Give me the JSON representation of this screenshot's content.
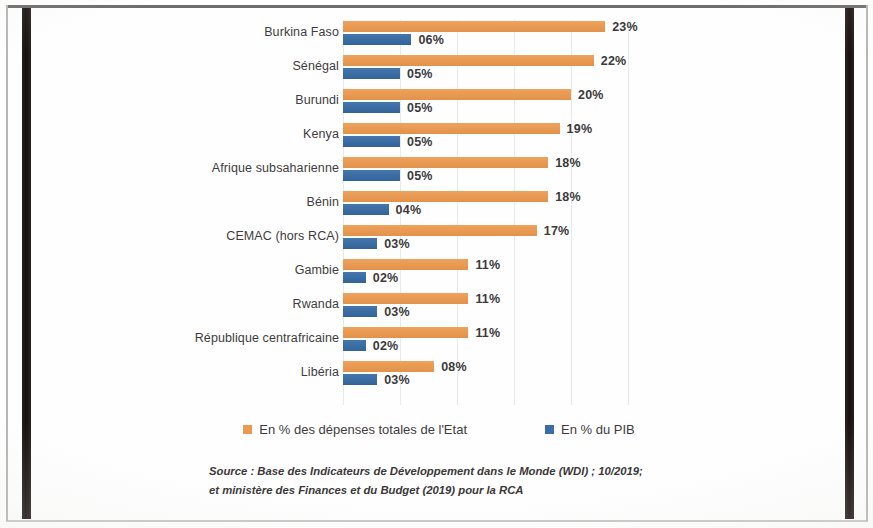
{
  "chart_data": {
    "type": "bar",
    "orientation": "horizontal",
    "title": "",
    "xlabel": "",
    "ylabel": "",
    "grid": true,
    "grid_axis": "x",
    "xlim": [
      0,
      25
    ],
    "legend_position": "bottom",
    "categories": [
      "Burkina Faso",
      "Sénégal",
      "Burundi",
      "Kenya",
      "Afrique subsaharienne",
      "Bénin",
      "CEMAC (hors RCA)",
      "Gambie",
      "Rwanda",
      "République centrafricaine",
      "Libéria"
    ],
    "series": [
      {
        "name": "En % des dépenses totales de l'Etat",
        "color": "#eb9a50",
        "values": [
          23,
          22,
          20,
          19,
          18,
          18,
          17,
          11,
          11,
          11,
          8
        ],
        "labels": [
          "23%",
          "22%",
          "20%",
          "19%",
          "18%",
          "18%",
          "17%",
          "11%",
          "11%",
          "11%",
          "08%"
        ]
      },
      {
        "name": "En % du PIB",
        "color": "#3b6ea6",
        "values": [
          6,
          5,
          5,
          5,
          5,
          4,
          3,
          2,
          3,
          2,
          3
        ],
        "labels": [
          "06%",
          "05%",
          "05%",
          "05%",
          "05%",
          "04%",
          "03%",
          "02%",
          "03%",
          "02%",
          "03%"
        ]
      }
    ],
    "source_lines": [
      "Source : Base des Indicateurs de Développement dans le Monde (WDI) ; 10/2019;",
      "et ministère des Finances et du Budget (2019) pour la RCA"
    ]
  },
  "legend": {
    "items": [
      {
        "label": "En % des dépenses totales de l'Etat",
        "swatch": "orange"
      },
      {
        "label": "En % du PIB",
        "swatch": "blue"
      }
    ]
  },
  "colors": {
    "orange": "#eb9a50",
    "blue": "#3b6ea6",
    "text": "#3e3c3d",
    "gridline": "#e9e9ea",
    "frame": "#171110"
  }
}
